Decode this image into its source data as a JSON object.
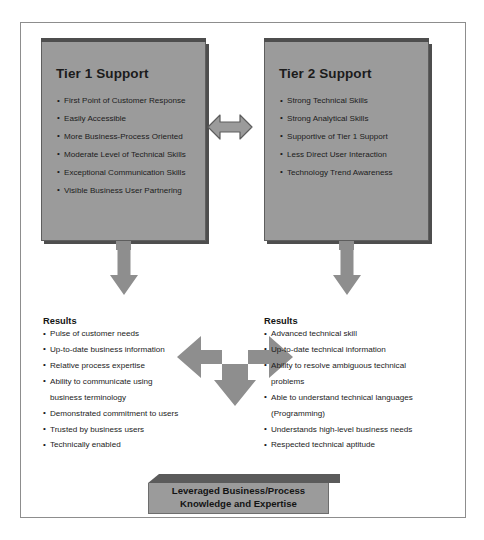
{
  "diagram": {
    "type": "two-tier-support-model",
    "colors": {
      "box_fill": "#9b9b9b",
      "box_shadow": "#4e4e4e",
      "arrow_fill": "#8e8e8e",
      "frame_border": "#8d8d8d",
      "text": "#1b1b1b",
      "banner_top": "#5b5b5b"
    },
    "tier1": {
      "title": "Tier 1 Support",
      "items": [
        "First Point of Customer Response",
        "Easily Accessible",
        "More Business-Process Oriented",
        "Moderate Level of Technical Skills",
        "Exceptional Communication Skills",
        "Visible Business User Partnering"
      ]
    },
    "tier2": {
      "title": "Tier 2 Support",
      "items": [
        "Strong Technical Skills",
        "Strong Analytical Skills",
        "Supportive of Tier 1 Support",
        "Less Direct User Interaction",
        "Technology Trend Awareness"
      ]
    },
    "results_left": {
      "title": "Results",
      "items": [
        {
          "text": "Pulse of customer needs",
          "bullet": true
        },
        {
          "text": "Up-to-date business information",
          "bullet": true
        },
        {
          "text": "Relative process expertise",
          "bullet": true
        },
        {
          "text": "Ability to communicate using",
          "bullet": true
        },
        {
          "text": "business terminology",
          "bullet": false
        },
        {
          "text": "Demonstrated commitment to users",
          "bullet": true
        },
        {
          "text": "Trusted by business users",
          "bullet": true
        },
        {
          "text": "Technically enabled",
          "bullet": true
        }
      ]
    },
    "results_right": {
      "title": "Results",
      "items": [
        {
          "text": "Advanced technical skill",
          "bullet": true
        },
        {
          "text": "Up-to-date technical information",
          "bullet": true
        },
        {
          "text": "Ability to resolve ambiguous technical",
          "bullet": true
        },
        {
          "text": "problems",
          "bullet": false
        },
        {
          "text": "Able to understand technical languages",
          "bullet": true
        },
        {
          "text": "(Programming)",
          "bullet": false
        },
        {
          "text": "Understands high-level business needs",
          "bullet": true
        },
        {
          "text": "Respected technical aptitude",
          "bullet": true
        }
      ]
    },
    "banner": {
      "line1": "Leveraged Business/Process",
      "line2": "Knowledge and Expertise"
    },
    "connectors": {
      "exchange_arrow": "double-headed-horizontal-arrow",
      "tier1_down_arrow": "down-arrow",
      "tier2_down_arrow": "down-arrow",
      "tri_arrow": "left-right-down-arrow"
    }
  }
}
